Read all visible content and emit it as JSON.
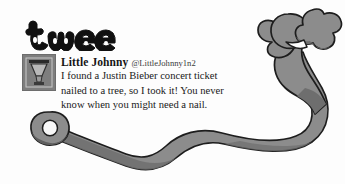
{
  "image": {
    "kind": "meme-graphic",
    "background_color": "#fdfdfd"
  },
  "brand": {
    "wordmark": "tweet",
    "style": "bubble-outline-letters",
    "color": "#101010"
  },
  "bird": {
    "name": "cartoon-bird-with-long-ribbon-tail",
    "body_color": "#8c8c8c",
    "shade_color": "#6e6e6e",
    "outline_color": "#1d1d1d",
    "tail_hole_color": "#f7f7f7"
  },
  "tweet": {
    "avatar_label": "avatar-image-lamp",
    "display_name": "Little Johnny",
    "handle": "@LittleJohnny1n2",
    "lines": [
      "I found a Justin Bieber concert ticket",
      "nailed to a tree, so I took it! You never",
      "know when you might need a nail."
    ],
    "text_color": "#1a1a1a"
  }
}
